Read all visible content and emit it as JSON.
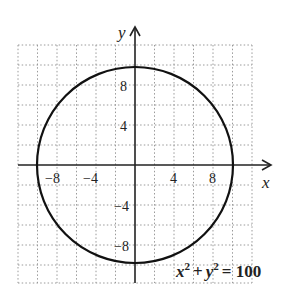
{
  "diagram": {
    "type": "graph-of-equation",
    "equation_label": "x² + y² = 100",
    "equation_parts": {
      "x": "x",
      "xexp": "2",
      "plus": "+",
      "y": "y",
      "yexp": "2",
      "eq": "= 100"
    },
    "x_axis_label": "x",
    "y_axis_label": "y",
    "x_ticks": [
      {
        "value": -8,
        "label": "−8"
      },
      {
        "value": -4,
        "label": "−4"
      },
      {
        "value": 4,
        "label": "4"
      },
      {
        "value": 8,
        "label": "8"
      }
    ],
    "y_ticks": [
      {
        "value": 8,
        "label": "8"
      },
      {
        "value": 4,
        "label": "4"
      },
      {
        "value": -4,
        "label": "−4"
      },
      {
        "value": -8,
        "label": "−8"
      }
    ],
    "grid": {
      "xmin": -12,
      "xmax": 12,
      "ymin": -12,
      "ymax": 12,
      "step": 2,
      "style": "dotted"
    },
    "circle": {
      "center": [
        0,
        0
      ],
      "radius": 10
    },
    "colors": {
      "grid": "#999999",
      "axes": "#222222",
      "curve": "#111111"
    }
  }
}
